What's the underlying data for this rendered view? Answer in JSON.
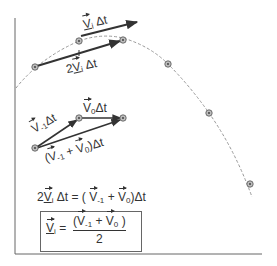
{
  "diagram": {
    "title": "",
    "axes": {
      "vertical": true,
      "horizontal": true
    },
    "trajectory": {
      "style": "dashed",
      "color": "#999999"
    },
    "points": [
      {
        "x": 35,
        "y": 67
      },
      {
        "x": 79,
        "y": 41
      },
      {
        "x": 123,
        "y": 40
      },
      {
        "x": 168,
        "y": 64
      },
      {
        "x": 209,
        "y": 113
      },
      {
        "x": 250,
        "y": 184
      }
    ],
    "upper_group": {
      "points": [
        {
          "x": 79,
          "y": 41
        },
        {
          "x": 35,
          "y": 67
        },
        {
          "x": 123,
          "y": 40
        }
      ],
      "label_vi": "V",
      "label_vi_sub": "i",
      "label_vi_suffix": " Δt",
      "label_2vi_prefix": "2",
      "label_2vi": "V",
      "label_2vi_sub": "i",
      "label_2vi_suffix": " Δt"
    },
    "lower_group": {
      "points": [
        {
          "x": 35,
          "y": 148
        },
        {
          "x": 79,
          "y": 118
        },
        {
          "x": 123,
          "y": 118
        }
      ],
      "label_vm1": "V",
      "label_vm1_sub": "-1",
      "label_vm1_suffix": "Δt",
      "label_v0": "V",
      "label_v0_sub": "0",
      "label_v0_suffix": "Δt",
      "label_sum_open": "(",
      "label_sum_a": "V",
      "label_sum_a_sub": "-1",
      "label_sum_plus": " + ",
      "label_sum_b": "V",
      "label_sum_b_sub": "0",
      "label_sum_close": ")Δt"
    },
    "equation1": {
      "lhs_prefix": "2",
      "lhs_v": "V",
      "lhs_sub": "i",
      "lhs_suffix": " Δt = ( ",
      "rhs_a": "V",
      "rhs_a_sub": "-1",
      "rhs_plus": " + ",
      "rhs_b": "V",
      "rhs_b_sub": "0",
      "rhs_suffix": ")Δt"
    },
    "equation2": {
      "lhs_v": "V",
      "lhs_sub": "i",
      "equals": " = ",
      "num_open": "(",
      "num_a": "V",
      "num_a_sub": "-1",
      "num_plus": " + ",
      "num_b": "V",
      "num_b_sub": "0",
      "num_close": " )",
      "denominator": "2"
    }
  }
}
